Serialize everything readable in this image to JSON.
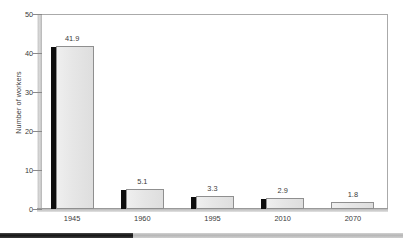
{
  "chart_data": {
    "type": "bar",
    "title": "",
    "subtitle": "",
    "xlabel": "",
    "ylabel": "Number of workers",
    "categories": [
      "1945",
      "1960",
      "1995",
      "2010",
      "2070"
    ],
    "values": [
      41.9,
      5.1,
      3.3,
      2.9,
      1.8
    ],
    "value_labels": [
      "41.9",
      "5.1",
      "3.3",
      "2.9",
      "1.8"
    ],
    "ylim": [
      0,
      50
    ],
    "yticks": [
      0,
      10,
      20,
      30,
      40,
      50
    ],
    "ytick_labels": [
      "0",
      "10",
      "20",
      "30",
      "40",
      "50"
    ],
    "grid": false,
    "legend": null,
    "series": [
      {
        "name": "Number of workers",
        "values": [
          41.9,
          5.1,
          3.3,
          2.9,
          1.8
        ]
      }
    ]
  },
  "style": {
    "bar_face_color": "#e6e6e6",
    "bar_edge_color": "#8f8f8f",
    "bar_shadow_color": "#0d0d0d",
    "axis_color": "#8a8a8a",
    "text_color": "#3a3a3a",
    "background": "#ffffff"
  },
  "footer": {
    "left_color": "#131313",
    "right_color": "#b6b6b6",
    "left_fraction": 33
  }
}
